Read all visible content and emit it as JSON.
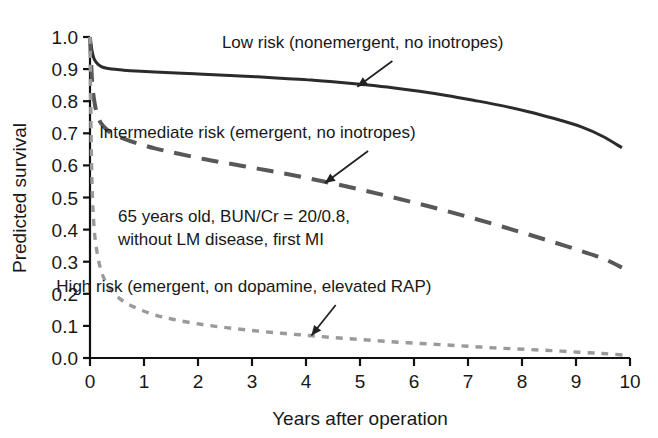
{
  "chart_data": {
    "type": "line",
    "title": "",
    "xlabel": "Years after operation",
    "ylabel": "Predicted survival",
    "xlim": [
      0,
      10
    ],
    "ylim": [
      0.0,
      1.0
    ],
    "grid": false,
    "legend_position": "inline-annotations",
    "xticks": [
      "0",
      "1",
      "2",
      "3",
      "4",
      "5",
      "6",
      "7",
      "8",
      "9",
      "10"
    ],
    "yticks": [
      "0.0",
      "0.1",
      "0.2",
      "0.3",
      "0.4",
      "0.5",
      "0.6",
      "0.7",
      "0.8",
      "0.9",
      "1.0"
    ],
    "annotation": {
      "line1": "65 years old, BUN/Cr = 20/0.8,",
      "line2": "without LM disease, first MI"
    },
    "series": [
      {
        "name": "Low risk (nonemergent, no inotropes)",
        "style": "solid",
        "color": "#2b2b2b",
        "label_position": {
          "x": 5.05,
          "y": 0.965
        },
        "arrow": {
          "from_x": 5.6,
          "from_y": 0.925,
          "to_x": 4.95,
          "to_y": 0.845
        },
        "x": [
          0,
          0.04,
          0.08,
          0.15,
          0.25,
          0.4,
          0.6,
          0.85,
          1.2,
          1.6,
          2.1,
          2.6,
          3.1,
          3.6,
          4.1,
          4.6,
          5.1,
          5.6,
          6.1,
          6.6,
          7.1,
          7.6,
          8.1,
          8.6,
          9.1,
          9.5,
          9.85
        ],
        "y": [
          1.0,
          0.955,
          0.93,
          0.915,
          0.905,
          0.9,
          0.897,
          0.894,
          0.891,
          0.888,
          0.884,
          0.88,
          0.876,
          0.871,
          0.866,
          0.859,
          0.851,
          0.842,
          0.831,
          0.818,
          0.803,
          0.787,
          0.768,
          0.746,
          0.72,
          0.69,
          0.655
        ]
      },
      {
        "name": "Intermediate risk (emergent, no inotropes)",
        "style": "dashed",
        "color": "#585858",
        "label_position": {
          "x": 3.1,
          "y": 0.685
        },
        "arrow": {
          "from_x": 5.15,
          "from_y": 0.645,
          "to_x": 4.35,
          "to_y": 0.545
        },
        "x": [
          0,
          0.04,
          0.09,
          0.16,
          0.26,
          0.4,
          0.6,
          0.85,
          1.2,
          1.6,
          2.1,
          2.6,
          3.1,
          3.6,
          4.1,
          4.6,
          5.1,
          5.6,
          6.1,
          6.6,
          7.1,
          7.6,
          8.1,
          8.6,
          9.1,
          9.5,
          9.85
        ],
        "y": [
          1.0,
          0.86,
          0.79,
          0.745,
          0.72,
          0.7,
          0.685,
          0.67,
          0.653,
          0.638,
          0.62,
          0.605,
          0.59,
          0.575,
          0.558,
          0.54,
          0.521,
          0.501,
          0.48,
          0.458,
          0.435,
          0.411,
          0.386,
          0.36,
          0.333,
          0.31,
          0.282
        ]
      },
      {
        "name": "High risk (emergent, on dopamine, elevated RAP)",
        "style": "dotted",
        "color": "#9a9a9a",
        "label_position": {
          "x": 2.85,
          "y": 0.205
        },
        "arrow": {
          "from_x": 4.55,
          "from_y": 0.165,
          "to_x": 4.1,
          "to_y": 0.07
        },
        "x": [
          0,
          0.03,
          0.07,
          0.13,
          0.22,
          0.35,
          0.55,
          0.8,
          1.15,
          1.55,
          2.05,
          2.55,
          3.05,
          3.55,
          4.05,
          4.55,
          5.05,
          5.55,
          6.05,
          6.55,
          7.05,
          7.55,
          8.05,
          8.55,
          9.05,
          9.5,
          9.9
        ],
        "y": [
          1.0,
          0.6,
          0.42,
          0.33,
          0.265,
          0.22,
          0.185,
          0.16,
          0.137,
          0.12,
          0.105,
          0.094,
          0.085,
          0.077,
          0.07,
          0.063,
          0.057,
          0.051,
          0.046,
          0.041,
          0.036,
          0.031,
          0.027,
          0.023,
          0.018,
          0.014,
          0.009
        ]
      }
    ]
  }
}
